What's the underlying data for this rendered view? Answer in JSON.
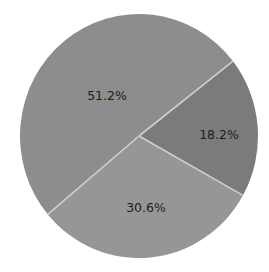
{
  "chart_data": {
    "type": "pie",
    "title": "",
    "legend": null,
    "center": [
      139,
      136
    ],
    "radius_x": 119,
    "radius_y": 122,
    "separator_color": "#cfcfcf",
    "slices": [
      {
        "label": "51.2%",
        "value": 51.2,
        "color": "#8d8d8d",
        "start_deg": 37.8,
        "end_deg": 220.0,
        "label_pos": [
          107,
          96
        ]
      },
      {
        "label": "30.6%",
        "value": 30.6,
        "color": "#969696",
        "start_deg": 220.0,
        "end_deg": 330.9,
        "label_pos": [
          146,
          208
        ]
      },
      {
        "label": "18.2%",
        "value": 18.2,
        "color": "#7b7b7b",
        "start_deg": 330.9,
        "end_deg": 397.8,
        "label_pos": [
          219,
          135
        ]
      }
    ],
    "values": [
      51.2,
      30.6,
      18.2
    ],
    "categories": [
      "51.2%",
      "30.6%",
      "18.2%"
    ]
  }
}
